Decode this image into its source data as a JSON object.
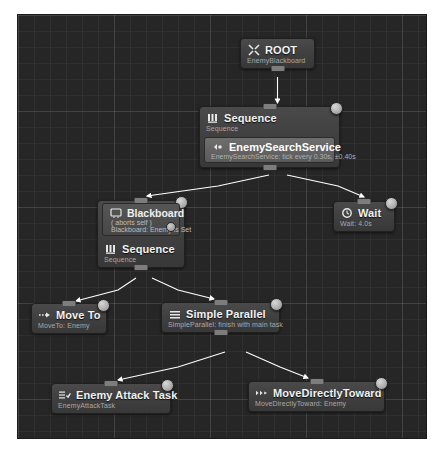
{
  "editor": {
    "name": "behavior-tree-graph",
    "canvas_background": "#262626",
    "grid_color": "#3a3a3a",
    "wire_color": "#ffffff"
  },
  "nodes": [
    {
      "id": "root",
      "title": "ROOT",
      "subtitle": "EnemyBlackboard",
      "icon": "root-icon",
      "index": "",
      "x": 240,
      "y": 38,
      "w": 75
    },
    {
      "id": "sequence-top",
      "title": "Sequence",
      "subtitle": "Sequence",
      "icon": "sequence-icon",
      "index": "0",
      "x": 199,
      "y": 106,
      "w": 141,
      "service": {
        "title": "EnemySearchService",
        "subtitle": "EnemySearchService: tick every 0.30s, ±0.40s",
        "icon": "service-icon"
      }
    },
    {
      "id": "blackboard-sequence",
      "title": "Blackboard",
      "subtitle": "Sequence",
      "icon": "blackboard-icon",
      "index": "1",
      "x": 97,
      "y": 200,
      "w": 88,
      "decorator": {
        "title": "Blackboard",
        "line1": "( aborts self )",
        "line2": "Blackboard: Enemy is Set",
        "icon": "blackboard-decorator-icon"
      },
      "body": {
        "title": "Sequence",
        "subtitle": "Sequence",
        "icon": "sequence-icon"
      }
    },
    {
      "id": "wait",
      "title": "Wait",
      "subtitle": "Wait: 4.0s",
      "icon": "wait-icon",
      "index": "2",
      "x": 333,
      "y": 201,
      "w": 62
    },
    {
      "id": "move-to",
      "title": "Move To",
      "subtitle": "MoveTo: Enemy",
      "icon": "move-to-icon",
      "index": "3",
      "x": 31,
      "y": 303,
      "w": 76
    },
    {
      "id": "simple-parallel",
      "title": "Simple Parallel",
      "subtitle": "SimpleParallel: finish with main task",
      "icon": "simple-parallel-icon",
      "index": "4",
      "x": 161,
      "y": 302,
      "w": 119
    },
    {
      "id": "enemy-attack-task",
      "title": "Enemy Attack Task",
      "subtitle": "EnemyAttackTask",
      "icon": "task-icon",
      "index": "5",
      "x": 51,
      "y": 383,
      "w": 120
    },
    {
      "id": "move-directly-toward",
      "title": "MoveDirectlyToward",
      "subtitle": "MoveDirectlyToward: Enemy",
      "icon": "move-directly-icon",
      "index": "6",
      "x": 248,
      "y": 381,
      "w": 137
    }
  ]
}
